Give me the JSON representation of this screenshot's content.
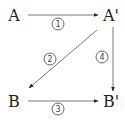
{
  "diagram": {
    "nodes": [
      {
        "id": "A",
        "label": "A",
        "x": 14,
        "y": 16
      },
      {
        "id": "A_prime",
        "label": "A'",
        "x": 111,
        "y": 16
      },
      {
        "id": "B",
        "label": "B",
        "x": 14,
        "y": 102
      },
      {
        "id": "B_prime",
        "label": "B'",
        "x": 111,
        "y": 102
      }
    ],
    "edges": [
      {
        "id": "e1",
        "from": "A",
        "to": "A_prime",
        "label": "1",
        "x1": 28,
        "y1": 15,
        "x2": 98,
        "y2": 15,
        "lx": 58,
        "ly": 24
      },
      {
        "id": "e2",
        "from": "A_prime",
        "to": "B",
        "label": "2",
        "x1": 97,
        "y1": 30,
        "x2": 29,
        "y2": 88,
        "lx": 50,
        "ly": 59
      },
      {
        "id": "e3",
        "from": "B",
        "to": "B_prime",
        "label": "3",
        "x1": 28,
        "y1": 101,
        "x2": 98,
        "y2": 101,
        "lx": 58,
        "ly": 109
      },
      {
        "id": "e4",
        "from": "A_prime",
        "to": "B_prime",
        "label": "4",
        "x1": 113,
        "y1": 27,
        "x2": 113,
        "y2": 91,
        "lx": 102,
        "ly": 57
      }
    ],
    "colors": {
      "line": "#777777",
      "arrowhead": "#222222",
      "text": "#222222"
    }
  }
}
